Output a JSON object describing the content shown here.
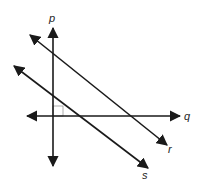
{
  "diagram": {
    "title": "",
    "stroke_color": "#1a1a1a",
    "marker_color": "#999999",
    "lines": [
      {
        "id": "p",
        "label": "p",
        "x1": 53,
        "y1": 28,
        "x2": 53,
        "y2": 166,
        "label_x": 49,
        "label_y": 22,
        "arrows": "both"
      },
      {
        "id": "q",
        "label": "q",
        "x1": 27,
        "y1": 116,
        "x2": 180,
        "y2": 116,
        "label_x": 184,
        "label_y": 120,
        "arrows": "both"
      },
      {
        "id": "r",
        "label": "r",
        "x1": 30,
        "y1": 35,
        "x2": 167,
        "y2": 145,
        "label_x": 168,
        "label_y": 153,
        "arrows": "both"
      },
      {
        "id": "s",
        "label": "s",
        "x1": 14,
        "y1": 66,
        "x2": 148,
        "y2": 168,
        "label_x": 142,
        "label_y": 179,
        "arrows": "both"
      }
    ],
    "right_angle_marker": {
      "at": "p-q intersection",
      "x": 53,
      "y": 106,
      "size": 10
    }
  }
}
